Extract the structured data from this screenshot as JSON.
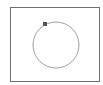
{
  "diagram": {
    "frame": {
      "x": 10,
      "y": 7,
      "width": 90,
      "height": 75,
      "stroke": "#6e6e6e"
    },
    "circle": {
      "cx": 56,
      "cy": 45,
      "r": 23,
      "stroke": "#a0a0a0",
      "stroke_width": 1
    },
    "marker": {
      "cx": 45,
      "cy": 24,
      "size": 4,
      "fill": "#555555"
    }
  }
}
